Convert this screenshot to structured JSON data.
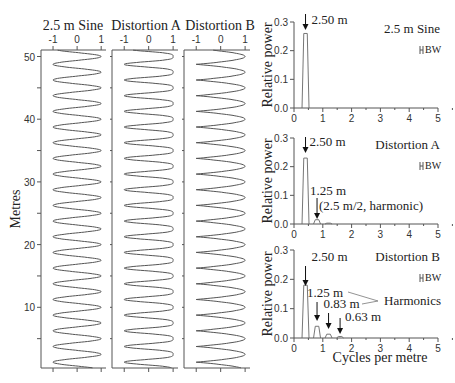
{
  "chart_data": [
    {
      "type": "line",
      "title": "2.5 m Sine",
      "xlabel": "",
      "ylabel": "Metres",
      "xlim": [
        -1.5,
        1.2
      ],
      "xticks": [
        "-1",
        "0",
        "1"
      ],
      "ylim": [
        0,
        51
      ],
      "yticks": [
        "10",
        "20",
        "30",
        "40",
        "50"
      ],
      "wavelength_m": 2.5,
      "shape": "sine"
    },
    {
      "type": "line",
      "title": "Distortion A",
      "xlabel": "",
      "ylabel": "",
      "xlim": [
        -1.5,
        1.2
      ],
      "xticks": [
        "-1",
        "0",
        "1"
      ],
      "ylim": [
        0,
        51
      ],
      "wavelength_m": 2.5,
      "shape": "distortion_a"
    },
    {
      "type": "line",
      "title": "Distortion B",
      "xlabel": "",
      "ylabel": "",
      "xlim": [
        -1.5,
        1.2
      ],
      "xticks": [
        "-1",
        "0",
        "1"
      ],
      "ylim": [
        0,
        51
      ],
      "wavelength_m": 2.5,
      "shape": "distortion_b"
    },
    {
      "type": "line",
      "title": "2.5 m Sine",
      "xlabel": "",
      "ylabel": "Relative power",
      "xlim": [
        0,
        5
      ],
      "xticks": [
        "0",
        "1",
        "2",
        "3",
        "4",
        "5"
      ],
      "ylim": [
        0,
        0.3
      ],
      "yticks": [
        "0.0",
        "0.1",
        "0.2",
        "0.3"
      ],
      "legend": "BW",
      "peaks": [
        {
          "x": 0.4,
          "y": 0.26
        }
      ],
      "annotations": [
        {
          "text": "2.50 m",
          "x": 0.4
        }
      ]
    },
    {
      "type": "line",
      "title": "Distortion A",
      "xlabel": "",
      "ylabel": "Relative power",
      "xlim": [
        0,
        5
      ],
      "xticks": [
        "0",
        "1",
        "2",
        "3",
        "4",
        "5"
      ],
      "ylim": [
        0,
        0.3
      ],
      "yticks": [
        "0.0",
        "0.1",
        "0.2",
        "0.3"
      ],
      "legend": "BW",
      "peaks": [
        {
          "x": 0.4,
          "y": 0.23
        },
        {
          "x": 0.8,
          "y": 0.015
        },
        {
          "x": 1.2,
          "y": 0.003
        }
      ],
      "annotations": [
        {
          "text": "2.50 m",
          "x": 0.4
        },
        {
          "text": "1.25 m",
          "x": 0.8
        },
        {
          "text": "(2.5 m/2, harmonic)",
          "x": 0.8
        }
      ]
    },
    {
      "type": "line",
      "title": "Distortion B",
      "xlabel": "Cycles per metre",
      "ylabel": "Relative power",
      "xlim": [
        0,
        5
      ],
      "xticks": [
        "0",
        "1",
        "2",
        "3",
        "4",
        "5"
      ],
      "ylim": [
        0,
        0.3
      ],
      "yticks": [
        "0.0",
        "0.1",
        "0.2",
        "0.3"
      ],
      "legend": "BW",
      "peaks": [
        {
          "x": 0.4,
          "y": 0.18
        },
        {
          "x": 0.8,
          "y": 0.04
        },
        {
          "x": 1.2,
          "y": 0.013
        },
        {
          "x": 1.6,
          "y": 0.005
        }
      ],
      "annotations": [
        {
          "text": "2.50 m",
          "x": 0.4
        },
        {
          "text": "1.25 m",
          "x": 0.8
        },
        {
          "text": "0.83 m",
          "x": 1.2
        },
        {
          "text": "0.63 m",
          "x": 1.6
        },
        {
          "text": "Harmonics",
          "x": 3.2
        }
      ]
    }
  ]
}
